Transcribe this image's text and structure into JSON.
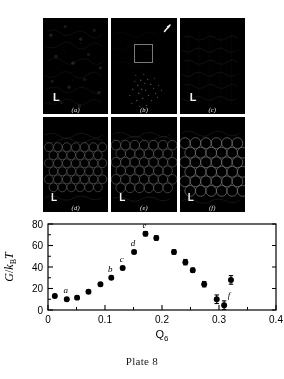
{
  "figure": {
    "caption": "Plate 8",
    "panels": [
      {
        "id": "a",
        "label": "(a)",
        "scale_marker": "L",
        "phase": "fluid",
        "state": "disordered fluid"
      },
      {
        "id": "b",
        "label": "(b)",
        "scale_marker": "",
        "phase": "nucleus",
        "state": "critical nucleus",
        "has_box": true,
        "has_arrow": true
      },
      {
        "id": "c",
        "label": "(c)",
        "scale_marker": "L",
        "phase": "fluid",
        "state": "partially ordered"
      },
      {
        "id": "d",
        "label": "(d)",
        "scale_marker": "L",
        "phase": "crystal",
        "state": "crystalline"
      },
      {
        "id": "e",
        "label": "(e)",
        "scale_marker": "L",
        "phase": "crystal",
        "state": "crystalline"
      },
      {
        "id": "f",
        "label": "(f)",
        "scale_marker": "L",
        "phase": "crystal",
        "state": "crystalline"
      }
    ]
  },
  "chart_data": {
    "type": "scatter",
    "title": "",
    "xlabel": "Q6",
    "xlabel_base": "Q",
    "xlabel_sub": "6",
    "ylabel": "G/kBT",
    "ylabel_parts": {
      "num": "G",
      "slash": "/",
      "k": "k",
      "sub": "B",
      "t": "T"
    },
    "xlim": [
      0,
      0.4
    ],
    "ylim": [
      0,
      80
    ],
    "xticks": [
      0,
      0.1,
      0.2,
      0.3,
      0.4
    ],
    "xtick_labels": [
      "0",
      "0.1",
      "0.2",
      "0.3",
      "0.4"
    ],
    "yticks": [
      0,
      20,
      40,
      60,
      80
    ],
    "ytick_labels": [
      "0",
      "20",
      "40",
      "60",
      "80"
    ],
    "x_minor_ticks": [
      0.05,
      0.15,
      0.25,
      0.35
    ],
    "y_minor_ticks": [
      10,
      30,
      50,
      70
    ],
    "grid": false,
    "legend": "none",
    "marker": {
      "shape": "circle",
      "color": "#000000",
      "size": 4.6
    },
    "points": [
      {
        "x": 0.012,
        "y": 13,
        "err": 1.5,
        "label": ""
      },
      {
        "x": 0.033,
        "y": 10,
        "err": 1.5,
        "label": "a"
      },
      {
        "x": 0.051,
        "y": 11.5,
        "err": 1.5,
        "label": ""
      },
      {
        "x": 0.071,
        "y": 17,
        "err": 1.5,
        "label": ""
      },
      {
        "x": 0.092,
        "y": 24,
        "err": 1.5,
        "label": ""
      },
      {
        "x": 0.111,
        "y": 30,
        "err": 1.5,
        "label": "b"
      },
      {
        "x": 0.131,
        "y": 39,
        "err": 1.5,
        "label": "c"
      },
      {
        "x": 0.151,
        "y": 54,
        "err": 1.5,
        "label": "d"
      },
      {
        "x": 0.171,
        "y": 71,
        "err": 2.0,
        "label": "e"
      },
      {
        "x": 0.19,
        "y": 67,
        "err": 2.0,
        "label": ""
      },
      {
        "x": 0.221,
        "y": 54,
        "err": 2.0,
        "label": ""
      },
      {
        "x": 0.241,
        "y": 44.5,
        "err": 2.5,
        "label": ""
      },
      {
        "x": 0.254,
        "y": 37,
        "err": 2.0,
        "label": ""
      },
      {
        "x": 0.274,
        "y": 24,
        "err": 2.5,
        "label": ""
      },
      {
        "x": 0.296,
        "y": 10,
        "err": 4.0,
        "label": ""
      },
      {
        "x": 0.309,
        "y": 4.5,
        "err": 4.0,
        "label": "f"
      },
      {
        "x": 0.321,
        "y": 28,
        "err": 4.0,
        "label": ""
      }
    ],
    "point_labels": [
      "a",
      "b",
      "c",
      "d",
      "e",
      "f"
    ]
  }
}
